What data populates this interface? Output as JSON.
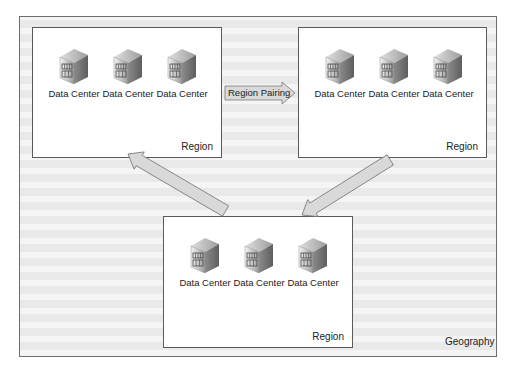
{
  "geography": {
    "label": "Geography"
  },
  "regions": [
    {
      "label": "Region",
      "data_centers": [
        {
          "label": "Data Center"
        },
        {
          "label": "Data Center"
        },
        {
          "label": "Data Center"
        }
      ]
    },
    {
      "label": "Region",
      "data_centers": [
        {
          "label": "Data Center"
        },
        {
          "label": "Data Center"
        },
        {
          "label": "Data Center"
        }
      ]
    },
    {
      "label": "Region",
      "data_centers": [
        {
          "label": "Data Center"
        },
        {
          "label": "Data Center"
        },
        {
          "label": "Data Center"
        }
      ]
    }
  ],
  "connectors": {
    "pairing_label": "Region Pairing",
    "icon_names": [
      "building-icon",
      "arrow-right-icon",
      "arrow-diagonal-icon"
    ]
  },
  "colors": {
    "arrow_fill": "#d9d9d9",
    "arrow_stroke": "#7a7a7a",
    "border": "#5a5a5a",
    "background": "#efefef"
  }
}
